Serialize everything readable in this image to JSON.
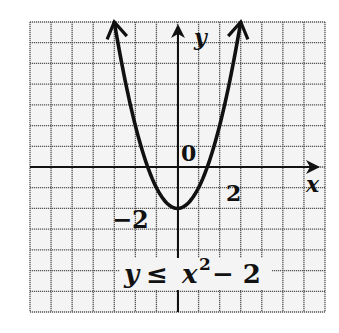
{
  "figure": {
    "type": "inequality-graph",
    "inequality_label": {
      "lhs": "y",
      "symbol": "≤",
      "base": "x",
      "exponent": "2",
      "rest": "− 2"
    },
    "axes": {
      "x_label": "x",
      "y_label": "y",
      "origin_label": "0",
      "tick_labels": {
        "x_positive": "2",
        "y_negative": "−2"
      }
    },
    "grid": {
      "x_min": -7,
      "x_max": 7,
      "y_min": -7,
      "y_max": 7,
      "step": 1
    },
    "curve": {
      "equation": "y = x^2 - 2",
      "vertex": [
        0,
        -2
      ],
      "style": "solid",
      "arrows_at_ends": true,
      "x_range": [
        -3,
        3
      ]
    },
    "colors": {
      "ink": "#111111",
      "grid": "#555555",
      "background": "#f4f4f4"
    }
  }
}
